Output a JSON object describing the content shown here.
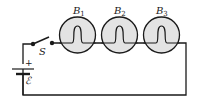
{
  "diagram": {
    "type": "circuit",
    "colors": {
      "wire": "#1a1a1a",
      "bulb_fill": "#e3e3e3",
      "background": "#ffffff"
    },
    "switch": {
      "label": "S",
      "state": "open"
    },
    "battery": {
      "label": "ℰ",
      "positive_label": "+"
    },
    "bulbs": [
      {
        "label": "B",
        "sub": "1"
      },
      {
        "label": "B",
        "sub": "2"
      },
      {
        "label": "B",
        "sub": "3"
      }
    ]
  }
}
